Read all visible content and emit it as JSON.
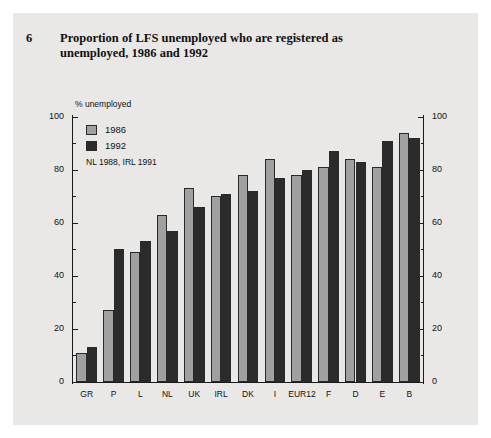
{
  "figure": {
    "number": "6",
    "title": "Proportion of LFS unemployed who are registered as unemployed, 1986 and 1992",
    "unit_label": "% unemployed",
    "note": "NL 1988, IRL 1991"
  },
  "legend": {
    "position": "inside-top-left",
    "entries": [
      {
        "label": "1986",
        "color": "#a0a0a0"
      },
      {
        "label": "1992",
        "color": "#2b2b2b"
      }
    ]
  },
  "axis": {
    "y_major_ticks": [
      "0",
      "20",
      "40",
      "60",
      "80",
      "100"
    ],
    "y_minor_ticks": [
      "10",
      "30",
      "50",
      "70",
      "90"
    ],
    "y_min": 0,
    "y_max": 100
  },
  "chart_data": {
    "type": "bar",
    "title": "Proportion of LFS unemployed who are registered as unemployed, 1986 and 1992",
    "xlabel": "",
    "ylabel": "% unemployed",
    "ylim": [
      0,
      100
    ],
    "grid": false,
    "legend_position": "inside-top-left",
    "annotations": [
      "NL 1988, IRL 1991"
    ],
    "categories": [
      "GR",
      "P",
      "L",
      "NL",
      "UK",
      "IRL",
      "DK",
      "I",
      "EUR12",
      "F",
      "D",
      "E",
      "B"
    ],
    "series": [
      {
        "name": "1986",
        "color": "#a0a0a0",
        "values": [
          11,
          27,
          49,
          63,
          73,
          70,
          78,
          84,
          78,
          81,
          84,
          81,
          94
        ]
      },
      {
        "name": "1992",
        "color": "#2b2b2b",
        "values": [
          13,
          50,
          53,
          57,
          66,
          71,
          72,
          77,
          80,
          87,
          83,
          91,
          92
        ]
      }
    ]
  }
}
